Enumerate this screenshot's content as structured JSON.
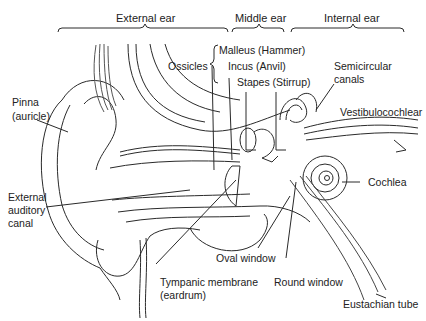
{
  "diagram": {
    "sections": [
      {
        "label": "External ear"
      },
      {
        "label": "Middle ear"
      },
      {
        "label": "Internal ear"
      }
    ],
    "labels": {
      "ossicles": "Ossicles",
      "malleus": "Malleus (Hammer)",
      "incus": "Incus (Anvil)",
      "stapes": "Stapes (Stirrup)",
      "semicircular_1": "Semicircular",
      "semicircular_2": "canals",
      "vestibulocochlear": "Vestibulocochlear",
      "pinna_1": "Pinna",
      "pinna_2": "(auricle)",
      "external_canal_1": "External",
      "external_canal_2": "auditory",
      "external_canal_3": "canal",
      "cochlea": "Cochlea",
      "oval_window": "Oval window",
      "tympanic_1": "Tympanic membrane",
      "tympanic_2": "(eardrum)",
      "round_window": "Round window",
      "eustachian": "Eustachian tube"
    },
    "colors": {
      "line": "#2a2a2a",
      "background": "#ffffff"
    }
  }
}
